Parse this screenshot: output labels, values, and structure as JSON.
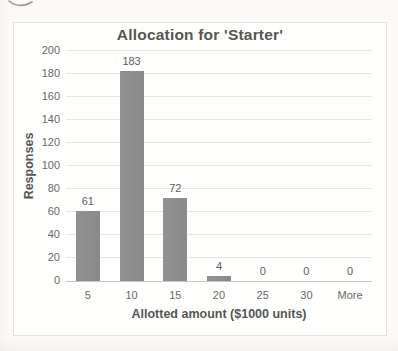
{
  "chart_data": {
    "type": "bar",
    "title": "Allocation for 'Starter'",
    "xlabel": "Allotted amount ($1000 units)",
    "ylabel": "Responses",
    "categories": [
      "5",
      "10",
      "15",
      "20",
      "25",
      "30",
      "More"
    ],
    "values": [
      61,
      183,
      72,
      4,
      0,
      0,
      0
    ],
    "data_labels": [
      "61",
      "183",
      "72",
      "4",
      "0",
      "0",
      "0"
    ],
    "ylim": [
      0,
      200
    ],
    "yticks": [
      0,
      20,
      40,
      60,
      80,
      100,
      120,
      140,
      160,
      180,
      200
    ],
    "grid": true,
    "legend": "none",
    "bar_color": "#8d8d8d",
    "text_color": "#565656",
    "tick_color": "#686868",
    "gridline_color": "#e8e7e3",
    "axis_line_color": "#c6c5c1",
    "background_color": "#fbfaf8"
  }
}
